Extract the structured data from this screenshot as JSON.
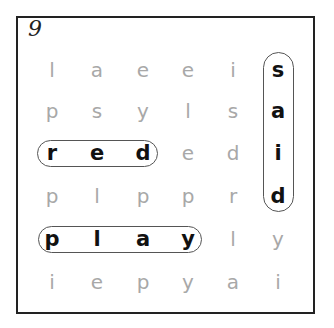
{
  "puzzle": {
    "number": "9",
    "grid": [
      [
        "l",
        "a",
        "e",
        "e",
        "i",
        "s"
      ],
      [
        "p",
        "s",
        "y",
        "l",
        "s",
        "a"
      ],
      [
        "r",
        "e",
        "d",
        "e",
        "d",
        "i"
      ],
      [
        "p",
        "l",
        "p",
        "p",
        "r",
        "d"
      ],
      [
        "p",
        "l",
        "a",
        "y",
        "l",
        "y"
      ],
      [
        "i",
        "e",
        "p",
        "y",
        "a",
        "i"
      ]
    ],
    "found_words": [
      {
        "word": "said",
        "direction": "vertical",
        "start": [
          0,
          5
        ],
        "end": [
          3,
          5
        ]
      },
      {
        "word": "red",
        "direction": "horizontal",
        "start": [
          2,
          0
        ],
        "end": [
          2,
          2
        ]
      },
      {
        "word": "play",
        "direction": "horizontal",
        "start": [
          4,
          0
        ],
        "end": [
          4,
          3
        ]
      }
    ],
    "colors": {
      "unfound_letter": "#a8a8a8",
      "found_letter": "#111111",
      "loop_border": "#555555",
      "frame_border": "#222222"
    }
  }
}
